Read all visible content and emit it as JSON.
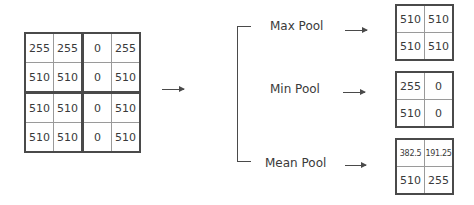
{
  "input_matrix": {
    "rows": [
      [
        "255",
        "255",
        "0",
        "255"
      ],
      [
        "510",
        "510",
        "0",
        "510"
      ],
      [
        "510",
        "510",
        "0",
        "510"
      ],
      [
        "510",
        "510",
        "0",
        "510"
      ]
    ]
  },
  "operations": [
    {
      "label": "Max Pool",
      "result": [
        [
          "510",
          "510"
        ],
        [
          "510",
          "510"
        ]
      ]
    },
    {
      "label": "Min Pool",
      "result": [
        [
          "255",
          "0"
        ],
        [
          "510",
          "0"
        ]
      ]
    },
    {
      "label": "Mean Pool",
      "result": [
        [
          "382.5",
          "191.25"
        ],
        [
          "510",
          "255"
        ]
      ]
    }
  ],
  "colors": {
    "line": "#4a4a4a",
    "text": "#3a3a3a",
    "inner_grid": "#9a9a9a"
  }
}
